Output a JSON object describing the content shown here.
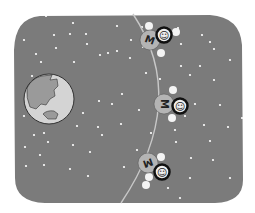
{
  "scene": {
    "title": "",
    "colors": {
      "page_bg": "#ffffff",
      "space": "#7b7b7b",
      "star": "#ffffff",
      "orbit": "#c8c8c8",
      "earth_ocean": "#d4d4d4",
      "earth_land": "#9a9a9a",
      "earth_outline": "#333333",
      "big_ball": "#b4b4b4",
      "face_ring": "#111111",
      "face_fill": "#eeeeee",
      "atom": "#f4f4f4"
    },
    "earth": {
      "cx": 49,
      "cy": 99,
      "r": 25
    },
    "orbit_path": "M133,14 Q190,100 121,203",
    "molecules": [
      {
        "label": "M",
        "face": "☺",
        "cx": 150,
        "cy": 40,
        "rotate": 20,
        "face_dx": 14,
        "face_dy": -5,
        "atoms": [
          [
            -1,
            -14
          ],
          [
            11,
            13
          ],
          [
            26,
            -8
          ]
        ]
      },
      {
        "label": "M",
        "face": "☺",
        "cx": 164,
        "cy": 104,
        "rotate": 90,
        "face_dx": 16,
        "face_dy": 2,
        "atoms": [
          [
            9,
            -14
          ],
          [
            8,
            14
          ]
        ]
      },
      {
        "label": "M",
        "face": "☺",
        "cx": 148,
        "cy": 163,
        "rotate": 160,
        "face_dx": 14,
        "face_dy": 9,
        "atoms": [
          [
            13,
            -6
          ],
          [
            1,
            14
          ],
          [
            -2,
            22
          ]
        ]
      }
    ],
    "stars": [
      [
        46,
        16
      ],
      [
        73,
        23
      ],
      [
        24,
        40
      ],
      [
        54,
        35
      ],
      [
        70,
        34
      ],
      [
        86,
        34
      ],
      [
        117,
        26
      ],
      [
        87,
        44
      ],
      [
        131,
        40
      ],
      [
        108,
        53
      ],
      [
        56,
        48
      ],
      [
        74,
        62
      ],
      [
        36,
        54
      ],
      [
        41,
        62
      ],
      [
        100,
        55
      ],
      [
        117,
        51
      ],
      [
        130,
        58
      ],
      [
        181,
        44
      ],
      [
        202,
        35
      ],
      [
        210,
        42
      ],
      [
        214,
        49
      ],
      [
        230,
        60
      ],
      [
        190,
        75
      ],
      [
        200,
        66
      ],
      [
        214,
        80
      ],
      [
        181,
        66
      ],
      [
        220,
        105
      ],
      [
        175,
        130
      ],
      [
        228,
        127
      ],
      [
        195,
        104
      ],
      [
        185,
        116
      ],
      [
        204,
        125
      ],
      [
        210,
        141
      ],
      [
        176,
        142
      ],
      [
        191,
        158
      ],
      [
        213,
        160
      ],
      [
        230,
        178
      ],
      [
        190,
        178
      ],
      [
        180,
        198
      ],
      [
        32,
        76
      ],
      [
        24,
        116
      ],
      [
        34,
        135
      ],
      [
        44,
        133
      ],
      [
        48,
        142
      ],
      [
        25,
        147
      ],
      [
        26,
        166
      ],
      [
        40,
        155
      ],
      [
        44,
        165
      ],
      [
        73,
        145
      ],
      [
        70,
        169
      ],
      [
        90,
        152
      ],
      [
        88,
        176
      ],
      [
        83,
        113
      ],
      [
        99,
        101
      ],
      [
        122,
        94
      ],
      [
        112,
        104
      ],
      [
        146,
        73
      ],
      [
        143,
        47
      ],
      [
        137,
        150
      ],
      [
        160,
        79
      ],
      [
        124,
        167
      ],
      [
        121,
        124
      ],
      [
        102,
        135
      ],
      [
        77,
        126
      ],
      [
        98,
        127
      ],
      [
        139,
        110
      ],
      [
        151,
        133
      ],
      [
        168,
        170
      ],
      [
        168,
        188
      ],
      [
        60,
        109
      ],
      [
        178,
        28
      ],
      [
        242,
        118
      ],
      [
        142,
        27
      ]
    ]
  }
}
